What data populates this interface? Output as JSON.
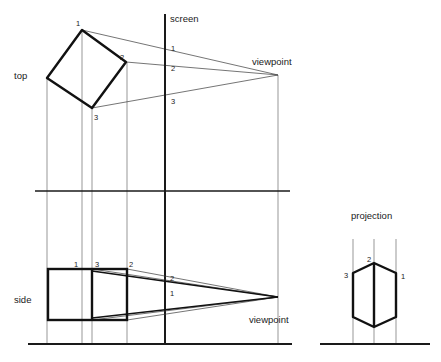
{
  "figure": {
    "title": "",
    "type": "perspective-projection-construction",
    "width": 441,
    "height": 362,
    "background_color": "#ffffff",
    "line_color": "#1a1a1a",
    "thin_line_color": "#555555"
  },
  "labels": {
    "top_view": "top",
    "side_view": "side",
    "screen": "screen",
    "viewpoint_top": "viewpoint",
    "viewpoint_side": "viewpoint",
    "projection": "projection"
  },
  "vertex_labels": {
    "top_object": [
      "1",
      "2",
      "3"
    ],
    "top_screen": [
      "1",
      "2",
      "3"
    ],
    "side_object": [
      "1",
      "3",
      "2"
    ],
    "side_screen": [
      "2",
      "1"
    ],
    "projection": [
      "3",
      "2",
      "1"
    ]
  },
  "geometry": {
    "top_view": {
      "square_vertices": [
        [
          82,
          30
        ],
        [
          126,
          62
        ],
        [
          92,
          108
        ],
        [
          47,
          78
        ]
      ],
      "vertex_1": [
        82,
        30
      ],
      "vertex_2": [
        126,
        62
      ],
      "vertex_3": [
        92,
        108
      ],
      "viewpoint": [
        278,
        75
      ],
      "screen_x": 165,
      "screen_hits": [
        [
          165,
          48
        ],
        [
          165,
          66
        ],
        [
          165,
          96
        ]
      ]
    },
    "side_view": {
      "box_left": 48,
      "box_right": 127,
      "box_top": 269,
      "box_bottom": 320,
      "inner_divider_x": 92,
      "viewpoint": [
        278,
        297
      ],
      "screen_x": 165,
      "screen_hits": [
        [
          165,
          281
        ],
        [
          165,
          290
        ]
      ]
    },
    "projection": {
      "center_x": 374,
      "lines_x": [
        353,
        374,
        396
      ],
      "baseline_y": 344,
      "baseline_x1": 320,
      "baseline_x2": 430,
      "top_y": 239,
      "hexagon": [
        [
          353,
          273
        ],
        [
          374,
          263
        ],
        [
          396,
          273
        ],
        [
          396,
          317
        ],
        [
          374,
          327
        ],
        [
          353,
          317
        ]
      ],
      "vertical_edge": [
        [
          374,
          263
        ],
        [
          374,
          327
        ]
      ]
    },
    "rules": {
      "horizontal_divider": {
        "y": 191,
        "x1": 35,
        "x2": 290
      },
      "baseline": {
        "y": 344,
        "x1": 28,
        "x2": 292
      },
      "vertical_guides_x": [
        82,
        92,
        127,
        165,
        278
      ],
      "screen_line": {
        "x": 165,
        "y1": 14,
        "y2": 344
      }
    }
  },
  "label_positions": {
    "top": [
      14,
      75
    ],
    "side": [
      14,
      299
    ],
    "screen": [
      170,
      18
    ],
    "viewpoint_top": [
      253,
      61
    ],
    "viewpoint_side": [
      250,
      320
    ],
    "projection": [
      352,
      215
    ],
    "top_num_1": [
      78,
      25
    ],
    "top_num_2": [
      122,
      58
    ],
    "top_num_3": [
      95,
      117
    ],
    "screen_num_1": [
      170,
      48
    ],
    "screen_num_2": [
      170,
      68
    ],
    "screen_num_3": [
      170,
      101
    ],
    "side_num_1": [
      74,
      265
    ],
    "side_num_3": [
      95,
      265
    ],
    "side_num_2": [
      130,
      265
    ],
    "side_screen_num_2": [
      169,
      279
    ],
    "side_screen_num_1": [
      169,
      294
    ],
    "proj_num_3": [
      344,
      275
    ],
    "proj_num_2": [
      367,
      260
    ],
    "proj_num_1": [
      400,
      276
    ]
  }
}
